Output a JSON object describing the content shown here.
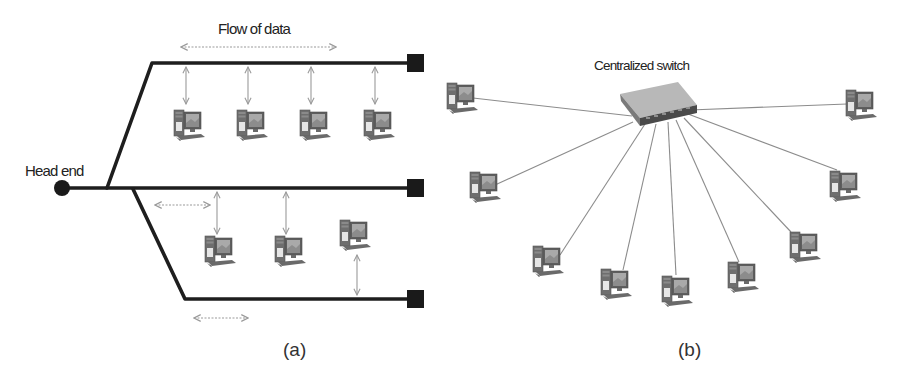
{
  "figure": {
    "panel_a": {
      "caption": "(a)",
      "title": "Bus topology",
      "labels": {
        "head_end": "Head end",
        "flow_of_data": "Flow of data"
      },
      "nodes": {
        "top_bus_pcs": 4,
        "middle_bus_pcs": 2,
        "bottom_bus_pcs": 1
      }
    },
    "panel_b": {
      "caption": "(b)",
      "title": "Star topology",
      "labels": {
        "switch": "Centralized switch"
      },
      "nodes": {
        "pcs": 9
      }
    }
  },
  "colors": {
    "bus_line": "#1e1e1e",
    "terminator": "#1a1a1a",
    "arrow": "#9a9a9a",
    "star_link": "#8c8c8c",
    "pc_body": "#6e6e6e",
    "pc_screen": "#a9a9a9",
    "switch_top": "#b8b8b8",
    "switch_front": "#4a4a4a"
  }
}
